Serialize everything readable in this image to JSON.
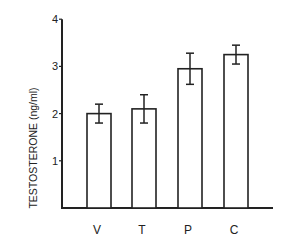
{
  "chart_data": {
    "type": "bar",
    "title": "",
    "xlabel": "",
    "ylabel": "TESTOSTERONE (ng/ml)",
    "categories": [
      "V",
      "T",
      "P",
      "C"
    ],
    "values": [
      2.0,
      2.1,
      2.95,
      3.25
    ],
    "error": [
      0.2,
      0.3,
      0.33,
      0.2
    ],
    "ylim": [
      0,
      4
    ],
    "yticks": [
      "1",
      "2",
      "3",
      "4"
    ],
    "grid": false,
    "legend": null,
    "bar_fill": "#ffffff",
    "bar_stroke": "#222222"
  }
}
